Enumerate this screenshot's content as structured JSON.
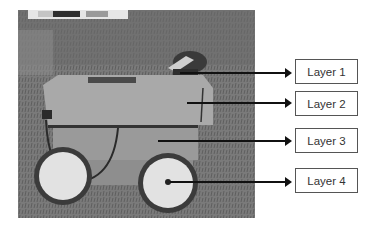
{
  "figure": {
    "photo": {
      "description": "Grayscale photo of a four-wheeled rover robot on grass",
      "colorbar_strip": [
        "#c8c8c8",
        "#2e2e2e",
        "#9a9a9a"
      ]
    },
    "labels": [
      {
        "text": "Layer 1",
        "target": "top sensor/camera mount"
      },
      {
        "text": "Layer 2",
        "target": "upper box"
      },
      {
        "text": "Layer 3",
        "target": "lower box"
      },
      {
        "text": "Layer 4",
        "target": "wheels"
      }
    ],
    "colors": {
      "arrow": "#111111",
      "box_border": "#555555",
      "text": "#333333",
      "background": "#ffffff"
    }
  }
}
